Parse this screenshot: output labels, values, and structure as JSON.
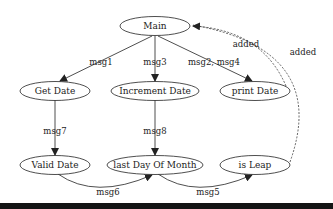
{
  "diagram": {
    "type": "call graph",
    "colors": {
      "stroke": "#222222",
      "background": "#ffffff",
      "bottom_bar": "#141414"
    },
    "nodes": [
      {
        "id": "main",
        "label": "Main"
      },
      {
        "id": "get_date",
        "label": "Get Date"
      },
      {
        "id": "increment_date",
        "label": "Increment Date"
      },
      {
        "id": "print_date",
        "label": "print Date"
      },
      {
        "id": "valid_date",
        "label": "Valid Date"
      },
      {
        "id": "last_day_of_month",
        "label": "last Day Of Month"
      },
      {
        "id": "is_leap",
        "label": "is Leap"
      }
    ],
    "edges": [
      {
        "from": "main",
        "to": "get_date",
        "label": "msg1",
        "style": "solid"
      },
      {
        "from": "main",
        "to": "increment_date",
        "label": "msg3",
        "style": "solid"
      },
      {
        "from": "main",
        "to": "print_date",
        "label": "msg2, msg4",
        "style": "solid"
      },
      {
        "from": "get_date",
        "to": "valid_date",
        "label": "msg7",
        "style": "solid"
      },
      {
        "from": "increment_date",
        "to": "last_day_of_month",
        "label": "msg8",
        "style": "solid"
      },
      {
        "from": "valid_date",
        "to": "last_day_of_month",
        "label": "msg6",
        "style": "solid"
      },
      {
        "from": "last_day_of_month",
        "to": "is_leap",
        "label": "msg5",
        "style": "solid"
      },
      {
        "from": "print_date",
        "to": "main",
        "label": "added",
        "style": "dashed"
      },
      {
        "from": "is_leap",
        "to": "main",
        "label": "added",
        "style": "dashed"
      }
    ]
  }
}
